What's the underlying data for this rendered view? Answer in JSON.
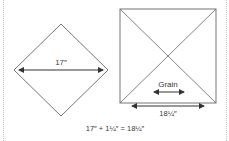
{
  "diagram": {
    "diamond": {
      "measurement_label": "17″"
    },
    "square": {
      "grain_label": "Grain",
      "measurement_label": "18¼″"
    },
    "formula": "17″ + 1¼″ = 18¼″",
    "colors": {
      "line": "#555555",
      "text": "#3a3a3a",
      "dotted_border": "#c9c9c9"
    }
  }
}
